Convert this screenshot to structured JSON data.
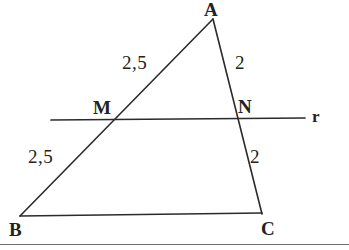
{
  "figure": {
    "background_color": "#ffffff",
    "stroke_color": "#2b2b2b",
    "vertices": {
      "A": {
        "label": "A",
        "x": 213,
        "y": 18
      },
      "B": {
        "label": "B",
        "x": 20,
        "y": 216
      },
      "C": {
        "label": "C",
        "x": 262,
        "y": 213
      }
    },
    "points": {
      "M": {
        "label": "M",
        "x": 113,
        "y": 119
      },
      "N": {
        "label": "N",
        "x": 238,
        "y": 119
      }
    },
    "transversal_line": {
      "label": "r",
      "x1": 51,
      "y1": 120,
      "x2": 305,
      "y2": 118
    },
    "segment_measures": [
      {
        "name": "AM",
        "label": "2,5"
      },
      {
        "name": "AN",
        "label": "2"
      },
      {
        "name": "MB",
        "label": "2,5"
      },
      {
        "name": "NC",
        "label": "2"
      }
    ],
    "baseline_rule": {
      "name": "page-bottom-rule",
      "y": 244
    }
  }
}
